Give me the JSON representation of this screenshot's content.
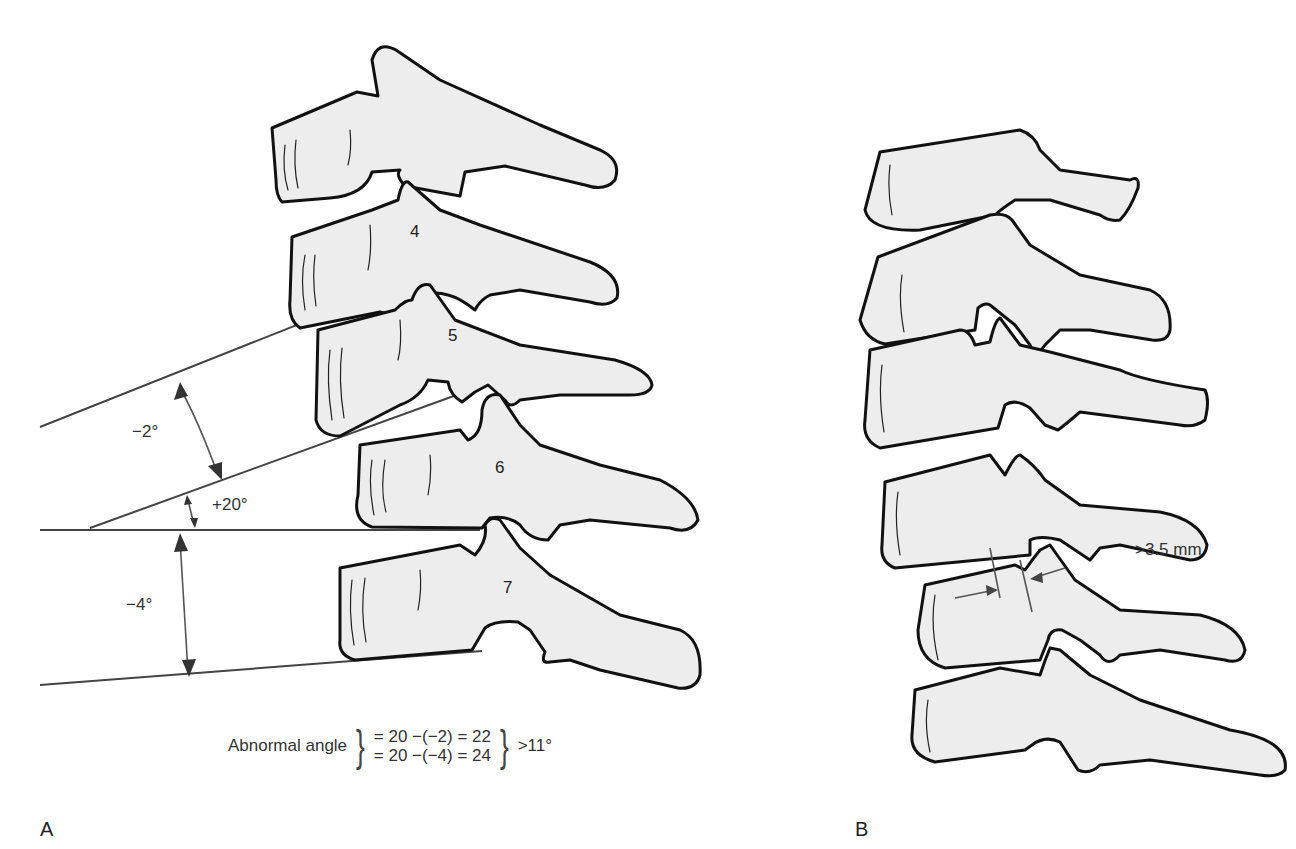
{
  "figure": {
    "panels": [
      {
        "id": "A",
        "label": "A"
      },
      {
        "id": "B",
        "label": "B"
      }
    ],
    "panel_a": {
      "vertebra_labels": [
        "4",
        "5",
        "6",
        "7"
      ],
      "angles": [
        {
          "name": "upper",
          "label": "−2°"
        },
        {
          "name": "middle",
          "label": "+20°"
        },
        {
          "name": "lower",
          "label": "−4°"
        }
      ],
      "formula": {
        "prefix": "Abnormal angle",
        "line1": "= 20 −(−2) = 22",
        "line2": "= 20 −(−4) = 24",
        "result": ">11°"
      }
    },
    "panel_b": {
      "measurement_label": ">3.5 mm"
    },
    "colors": {
      "bone_fill": "#ededed",
      "outline": "#111111",
      "reference_line": "#444444",
      "text": "#333333"
    }
  }
}
